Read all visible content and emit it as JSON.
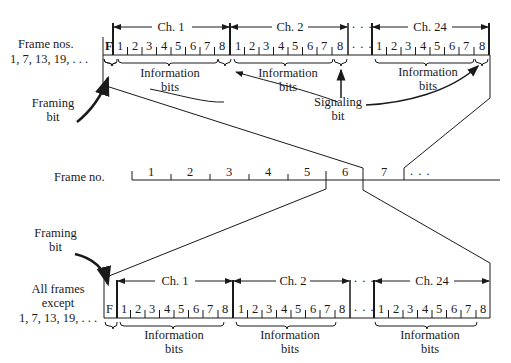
{
  "top_frame": {
    "label_line1": "Frame nos.",
    "label_line2": "1, 7, 13, 19, . . .",
    "framing_bit": "F",
    "channels": [
      {
        "label": "Ch. 1",
        "bits": [
          "1",
          "2",
          "3",
          "4",
          "5",
          "6",
          "7",
          "8"
        ]
      },
      {
        "label": "Ch. 2",
        "bits": [
          "1",
          "2",
          "3",
          "4",
          "5",
          "6",
          "7",
          "8"
        ]
      },
      {
        "label": "Ch. 24",
        "bits": [
          "1",
          "2",
          "3",
          "4",
          "5",
          "6",
          "7",
          "8"
        ]
      }
    ],
    "ellipsis": ". . .",
    "info_label_line1": "Information",
    "info_label_line2": "bits",
    "framing_label_line1": "Framing",
    "framing_label_line2": "bit",
    "signaling_label_line1": "Signaling",
    "signaling_label_line2": "bit"
  },
  "timeline": {
    "label": "Frame no.",
    "frames": [
      "1",
      "2",
      "3",
      "4",
      "5",
      "6",
      "7"
    ],
    "ellipsis": ". . ."
  },
  "bottom_frame": {
    "label_line1": "All frames",
    "label_line2": "except",
    "label_line3": "1, 7, 13, 19, . . .",
    "framing_bit": "F",
    "channels": [
      {
        "label": "Ch. 1",
        "bits": [
          "1",
          "2",
          "3",
          "4",
          "5",
          "6",
          "7",
          "8"
        ]
      },
      {
        "label": "Ch. 2",
        "bits": [
          "1",
          "2",
          "3",
          "4",
          "5",
          "6",
          "7",
          "8"
        ]
      },
      {
        "label": "Ch. 24",
        "bits": [
          "1",
          "2",
          "3",
          "4",
          "5",
          "6",
          "7",
          "8"
        ]
      }
    ],
    "ellipsis": ". . .",
    "info_label_line1": "Information",
    "info_label_line2": "bits",
    "framing_label_line1": "Framing",
    "framing_label_line2": "bit"
  }
}
